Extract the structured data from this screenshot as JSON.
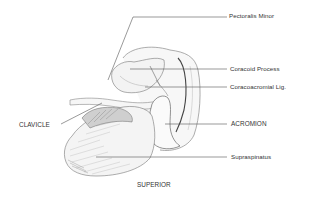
{
  "diagram": {
    "view": "SUPERIOR",
    "colors": {
      "background": "#ffffff",
      "ink": "#333333",
      "leader": "#555555",
      "shade": "#9a9a9a"
    },
    "labels": [
      {
        "id": "pectoralis-minor",
        "text": "Pectoralis Minor",
        "side": "right"
      },
      {
        "id": "coracoid-process",
        "text": "Coracoid Process",
        "side": "right"
      },
      {
        "id": "coracoacromial-lig",
        "text": "Coracoacromial Lig.",
        "side": "right"
      },
      {
        "id": "acromion",
        "text": "ACROMION",
        "side": "right"
      },
      {
        "id": "supraspinatus",
        "text": "Supraspinatus",
        "side": "right"
      },
      {
        "id": "clavicle",
        "text": "CLAVICLE",
        "side": "left"
      }
    ],
    "caption": "SUPERIOR"
  }
}
